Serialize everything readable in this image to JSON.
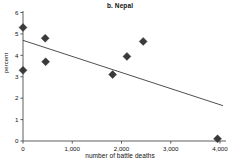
{
  "chart_data": {
    "type": "scatter",
    "title": "b. Nepal",
    "xlabel": "number of battle deaths",
    "ylabel": "percent",
    "xlim": [
      0,
      4100
    ],
    "ylim": [
      0,
      6
    ],
    "xticks": [
      0,
      1000,
      2000,
      3000,
      4000
    ],
    "xtick_labels": [
      "0",
      "1,000",
      "2,000",
      "3,000",
      "4,000"
    ],
    "yticks": [
      0,
      1,
      2,
      3,
      4,
      5,
      6
    ],
    "ytick_labels": [
      "0",
      "1",
      "2",
      "3",
      "4",
      "5",
      "6"
    ],
    "grid": false,
    "legend": null,
    "marker": "diamond",
    "marker_color": "#3a3a3a",
    "points": [
      {
        "x": 0,
        "y": 5.3
      },
      {
        "x": 0,
        "y": 3.3
      },
      {
        "x": 450,
        "y": 4.8
      },
      {
        "x": 460,
        "y": 3.7
      },
      {
        "x": 1820,
        "y": 3.1
      },
      {
        "x": 2110,
        "y": 3.95
      },
      {
        "x": 2440,
        "y": 4.65
      },
      {
        "x": 3950,
        "y": 0.1
      }
    ],
    "series": [
      {
        "name": "battle deaths vs percent",
        "x": [
          0,
          0,
          450,
          460,
          1820,
          2110,
          2440,
          3950
        ],
        "values": [
          5.3,
          3.3,
          4.8,
          3.7,
          3.1,
          3.95,
          4.65,
          0.1
        ]
      }
    ],
    "trendline": {
      "type": "line",
      "x": [
        0,
        4060
      ],
      "values": [
        4.7,
        1.65
      ],
      "color": "#3b3b3b"
    }
  }
}
